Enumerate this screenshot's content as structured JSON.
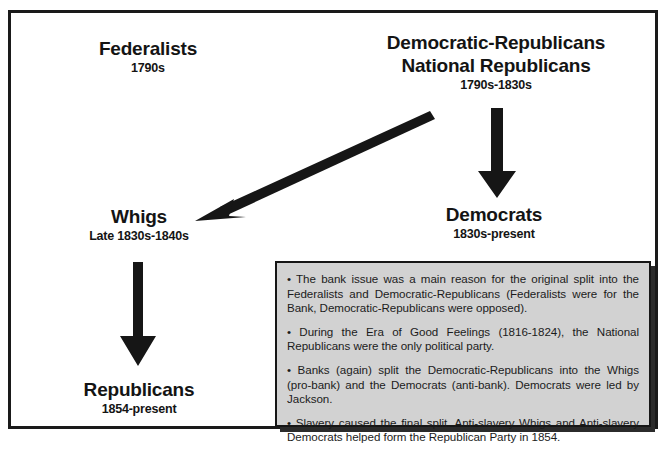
{
  "diagram": {
    "nodes": [
      {
        "id": "federalists",
        "name": "Federalists",
        "years": "1790s"
      },
      {
        "id": "democratic-republicans",
        "name": "Democratic-Republicans",
        "name2": "National Republicans",
        "years": "1790s-1830s"
      },
      {
        "id": "whigs",
        "name": "Whigs",
        "years": "Late 1830s-1840s"
      },
      {
        "id": "democrats",
        "name": "Democrats",
        "years": "1830s-present"
      },
      {
        "id": "republicans",
        "name": "Republicans",
        "years": "1854-present"
      }
    ],
    "arrows": [
      {
        "id": "demrep-to-democrats",
        "from": "democratic-republicans",
        "to": "democrats",
        "direction": "down"
      },
      {
        "id": "demrep-to-whigs",
        "from": "democratic-republicans",
        "to": "whigs",
        "direction": "diagonal-down-left"
      },
      {
        "id": "whigs-to-republicans",
        "from": "whigs",
        "to": "republicans",
        "direction": "down"
      }
    ]
  },
  "notes": {
    "items": [
      "• The bank issue was a main reason for the original split into the Federalists and Democratic-Republicans (Federalists were for the Bank, Democratic-Republicans were opposed).",
      "• During the Era of Good Feelings (1816-1824), the National Republicans were the only political party.",
      "• Banks (again) split the Democratic-Republicans into the Whigs (pro-bank) and the Democrats (anti-bank). Democrats were led by Jackson.",
      "• Slavery caused the final split. Anti-slavery Whigs and Anti-slavery Democrats helped form the Republican Party in 1854."
    ]
  },
  "colors": {
    "ink": "#141414",
    "frame": "#1a1a1a",
    "notes_background": "#d2d2d2",
    "page_background": "#ffffff"
  }
}
